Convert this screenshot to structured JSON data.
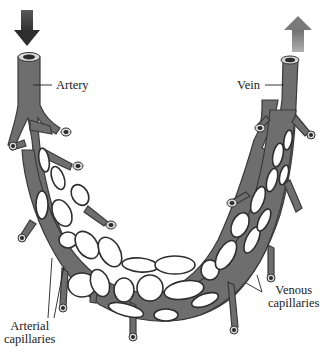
{
  "diagram": {
    "labels": {
      "artery": "Artery",
      "vein": "Vein",
      "venous_capillaries_line1": "Venous",
      "venous_capillaries_line2": "capillaries",
      "arterial_capillaries_line1": "Arterial",
      "arterial_capillaries_line2": "capillaries"
    },
    "arrows": {
      "artery_flow": {
        "direction": "down",
        "color": "#3c3c3c",
        "icon": "arrow-down-icon"
      },
      "vein_flow": {
        "direction": "up",
        "color": "#8a8a8a",
        "icon": "arrow-up-icon"
      }
    },
    "colors": {
      "vessel_fill": "#6e6e6e",
      "vessel_outline": "#3a3a3a",
      "background": "#ffffff",
      "text": "#1a1a1a"
    }
  }
}
